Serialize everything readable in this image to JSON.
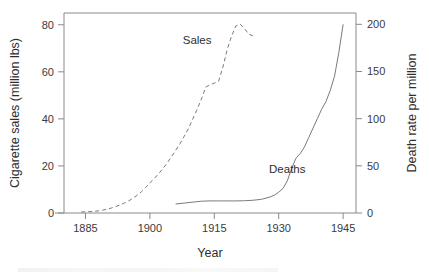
{
  "chart_data": {
    "type": "line",
    "title": "",
    "xlabel": "Year",
    "ylabel": "Cigarette sales (million lbs)",
    "y2label": "Death rate per million",
    "xlim": [
      1880,
      1948
    ],
    "ylim": [
      0,
      85
    ],
    "y2lim": [
      0,
      212
    ],
    "xticks": [
      1885,
      1900,
      1915,
      1930,
      1945
    ],
    "xticklabels": [
      "1885",
      "1900",
      "1915",
      "1930",
      "1945"
    ],
    "yticks": [
      0,
      20,
      40,
      60,
      80
    ],
    "yticklabels": [
      "0",
      "20",
      "40",
      "60",
      "80"
    ],
    "y2ticks": [
      0,
      50,
      100,
      150,
      200
    ],
    "y2ticklabels": [
      "0",
      "50",
      "100",
      "150",
      "200"
    ],
    "grid": false,
    "legend": "inline-annotations",
    "series": [
      {
        "name": "Sales",
        "axis": "left",
        "style": "dashed",
        "color": "#7a7a7a",
        "annotation": "Sales",
        "annotation_x": 1911.0,
        "annotation_y": 72.0,
        "x": [
          1884,
          1885,
          1886,
          1887,
          1888,
          1889,
          1890,
          1891,
          1892,
          1893,
          1894,
          1895,
          1896,
          1897,
          1898,
          1899,
          1900,
          1901,
          1902,
          1903,
          1904,
          1905,
          1906,
          1907,
          1908,
          1909,
          1910,
          1911,
          1912,
          1913,
          1914,
          1915,
          1916,
          1917,
          1918,
          1919,
          1920,
          1921,
          1922,
          1923,
          1924
        ],
        "y": [
          0.4,
          0.5,
          0.6,
          0.7,
          0.9,
          1.2,
          1.6,
          2.1,
          2.7,
          3.4,
          4.2,
          5.1,
          6.2,
          7.5,
          9.0,
          10.8,
          12.8,
          14.6,
          16.6,
          18.8,
          21.2,
          23.8,
          26.6,
          29.4,
          32.6,
          36.0,
          40.0,
          44.0,
          48.5,
          53.5,
          54.5,
          55.2,
          56.0,
          62.0,
          69.5,
          75.0,
          79.5,
          80.3,
          78.5,
          76.0,
          75.3
        ]
      },
      {
        "name": "Deaths",
        "axis": "right",
        "style": "solid",
        "color": "#7a7a7a",
        "annotation": "Deaths",
        "annotation_x": 1932.0,
        "annotation_y": 42.0,
        "x": [
          1906,
          1908,
          1910,
          1912,
          1914,
          1916,
          1918,
          1920,
          1922,
          1924,
          1926,
          1928,
          1929,
          1930,
          1931,
          1932,
          1933,
          1934,
          1935,
          1936,
          1937,
          1938,
          1939,
          1940,
          1941,
          1942,
          1943,
          1944,
          1945
        ],
        "y": [
          9.5,
          10.5,
          11.5,
          12.5,
          12.8,
          12.8,
          12.8,
          12.8,
          13.0,
          13.5,
          14.5,
          17.0,
          19.0,
          22.0,
          26.0,
          34.0,
          47.0,
          58.0,
          63.0,
          70.0,
          80.0,
          90.0,
          100.0,
          110.0,
          118.0,
          130.0,
          145.0,
          170.0,
          200.0
        ]
      }
    ]
  }
}
